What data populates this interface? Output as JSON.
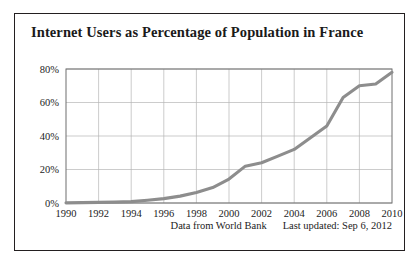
{
  "figure": {
    "title": "Internet Users as Percentage of Population in France",
    "source_note": "Data from World Bank",
    "updated_note": "Last updated: Sep 6, 2012",
    "border_color": "#231f20"
  },
  "chart_data": {
    "type": "line",
    "title": "Internet Users as Percentage of Population in France",
    "xlabel": "",
    "ylabel": "",
    "xlim": [
      1990,
      2010
    ],
    "ylim": [
      0,
      80
    ],
    "grid": true,
    "legend": "none",
    "line_color": "#8d8d8d",
    "x_tick_labels": [
      "1990",
      "1992",
      "1994",
      "1996",
      "1998",
      "2000",
      "2002",
      "2004",
      "2006",
      "2008",
      "2010"
    ],
    "x_ticks": [
      1990,
      1992,
      1994,
      1996,
      1998,
      2000,
      2002,
      2004,
      2006,
      2008,
      2010
    ],
    "y_tick_labels": [
      "0%",
      "20%",
      "40%",
      "60%",
      "80%"
    ],
    "y_ticks": [
      0,
      20,
      40,
      60,
      80
    ],
    "x": [
      1990,
      1991,
      1992,
      1993,
      1994,
      1995,
      1996,
      1997,
      1998,
      1999,
      2000,
      2001,
      2002,
      2003,
      2004,
      2005,
      2006,
      2007,
      2008,
      2009,
      2010
    ],
    "values": [
      0.1,
      0.2,
      0.4,
      0.5,
      0.8,
      1.6,
      2.6,
      4.1,
      6.3,
      9.2,
      14.3,
      22.0,
      24.0,
      28.0,
      32.0,
      39.0,
      46.0,
      63.0,
      70.0,
      71.0,
      78.0
    ],
    "series": [
      {
        "name": "Internet users (% of population)",
        "values": [
          0.1,
          0.2,
          0.4,
          0.5,
          0.8,
          1.6,
          2.6,
          4.1,
          6.3,
          9.2,
          14.3,
          22.0,
          24.0,
          28.0,
          32.0,
          39.0,
          46.0,
          63.0,
          70.0,
          71.0,
          78.0
        ]
      }
    ]
  }
}
